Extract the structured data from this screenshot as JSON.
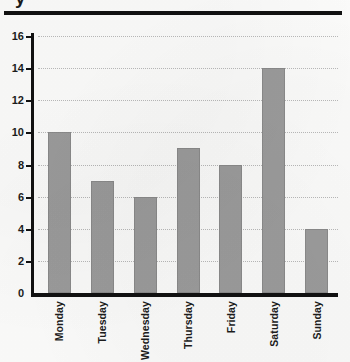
{
  "page": {
    "title_fragment": "y",
    "background_color": "#fbfbfa",
    "rule_color": "#111111"
  },
  "chart_data": {
    "type": "bar",
    "title": "",
    "xlabel": "",
    "ylabel": "",
    "categories": [
      "Monday",
      "Tuesday",
      "Wednesday",
      "Thursday",
      "Friday",
      "Saturday",
      "Sunday"
    ],
    "values": [
      10,
      7,
      6,
      9,
      8,
      14,
      4
    ],
    "ylim": [
      0,
      16
    ],
    "ytick_step": 2,
    "yticks": [
      0,
      2,
      4,
      6,
      8,
      10,
      12,
      14,
      16
    ],
    "ytick_labels": [
      "0",
      "2",
      "4",
      "6",
      "8",
      "10",
      "12",
      "14",
      "16"
    ],
    "grid": true,
    "grid_axis": "y",
    "grid_style": "dotted",
    "grid_color": "#b9b9b9",
    "legend": false,
    "bar_color": "#9b9b9b",
    "bar_edge_color": "#8a8a8a",
    "axis_color": "#111111",
    "xtick_rotation": 90
  }
}
